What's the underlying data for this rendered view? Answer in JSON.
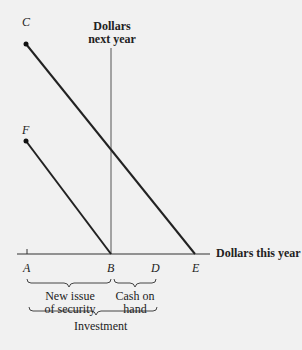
{
  "diagram": {
    "y_axis_label_line1": "Dollars",
    "y_axis_label_line2": "next year",
    "x_axis_label": "Dollars this year",
    "points": {
      "C": "C",
      "F": "F",
      "A": "A",
      "B": "B",
      "D": "D",
      "E": "E"
    },
    "braces": {
      "new_issue_line1": "New issue",
      "new_issue_line2": "of security",
      "cash_line1": "Cash on",
      "cash_line2": "hand",
      "investment": "Investment"
    },
    "lines": [
      {
        "from": "C",
        "to": "E"
      },
      {
        "from": "F",
        "to": "B"
      }
    ]
  }
}
